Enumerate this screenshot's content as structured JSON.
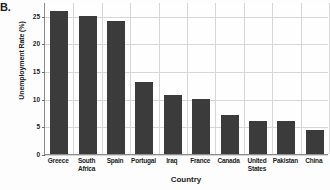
{
  "panel": {
    "letter": "B."
  },
  "chart_data": {
    "type": "bar",
    "title": "",
    "xlabel": "Country",
    "ylabel": "Unemployment Rate (%)",
    "categories": [
      "Greece",
      "South Africa",
      "Spain",
      "Portugal",
      "Iraq",
      "France",
      "Canada",
      "United States",
      "Pakistan",
      "China"
    ],
    "values": [
      25.9,
      25.0,
      24.0,
      13.1,
      10.7,
      10.0,
      7.0,
      6.0,
      6.0,
      4.4
    ],
    "ylim": [
      0,
      27.5
    ],
    "yticks": [
      0,
      5,
      10,
      15,
      20,
      25
    ],
    "ytick_labels": [
      "0",
      "5",
      "10",
      "15",
      "20",
      "25"
    ],
    "grid": true,
    "grid_axis": "both",
    "legend": false,
    "legend_position": "none",
    "bar_color": "#3b3b3b",
    "grid_color": "#d6d6d6",
    "axis_color": "#8c8c8c",
    "text_color": "#1c1c1c",
    "background_color": "#fefefe"
  }
}
